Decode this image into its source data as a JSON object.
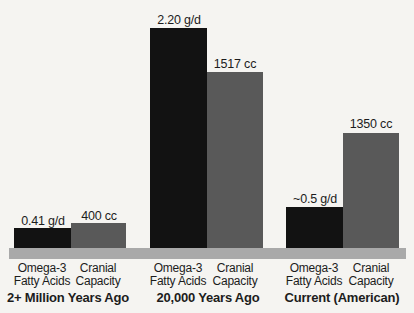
{
  "chart_data": {
    "type": "bar",
    "title": "",
    "categories": [
      "2+ Million Years Ago",
      "20,000 Years Ago",
      "Current (American)"
    ],
    "series": [
      {
        "name": "Omega-3 Fatty Acids",
        "unit": "g/d",
        "values": [
          0.41,
          2.2,
          0.5
        ],
        "value_labels": [
          "0.41 g/d",
          "2.20 g/d",
          "~0.5 g/d"
        ],
        "color": "#121212"
      },
      {
        "name": "Cranial Capacity",
        "unit": "cc",
        "values": [
          400,
          1517,
          1350
        ],
        "value_labels": [
          "400 cc",
          "1517 cc",
          "1350 cc"
        ],
        "color": "#595959"
      }
    ],
    "legend_position": "none",
    "grid": false,
    "layout_hint": "three grouped bar pairs standing on a light-gray baseline strip; numeric value labels above each bar; per-bar labels and bold period titles below the strip; bar heights are schematic, not to a common scale"
  },
  "groups": [
    {
      "title": "2+ Million Years Ago",
      "omega": {
        "value_label": "0.41 g/d",
        "axis_label": "Omega-3\nFatty Acids"
      },
      "cranial": {
        "value_label": "400 cc",
        "axis_label": "Cranial\nCapacity"
      }
    },
    {
      "title": "20,000 Years Ago",
      "omega": {
        "value_label": "2.20 g/d",
        "axis_label": "Omega-3\nFatty Acids"
      },
      "cranial": {
        "value_label": "1517 cc",
        "axis_label": "Cranial\nCapacity"
      }
    },
    {
      "title": "Current (American)",
      "omega": {
        "value_label": "~0.5 g/d",
        "axis_label": "Omega-3\nFatty Acids"
      },
      "cranial": {
        "value_label": "1350 cc",
        "axis_label": "Cranial\nCapacity"
      }
    }
  ],
  "colors": {
    "background": "#f5f4f1",
    "bar_omega": "#121212",
    "bar_cranial": "#595959",
    "baseline_strip": "#a9a9a9",
    "text": "#1c1c1c"
  }
}
